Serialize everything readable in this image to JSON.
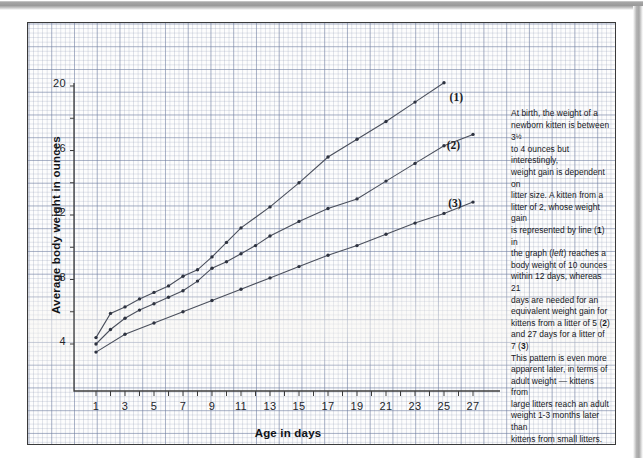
{
  "figure": {
    "x_axis_title": "Age in days",
    "y_axis_title": "Average body weight in ounces"
  },
  "note": {
    "paragraph": "At birth, the weight of a newborn kitten is between 3½ to 4 ounces but interestingly, weight gain is dependent on litter size. A kitten from a litter of 2, whose weight gain is represented by line (1) in the graph (left) reaches a body weight of 10 ounces within 12 days, whereas 21 days are needed for an equivalent weight gain for kittens from a litter of 5 (2) and 27 days for a litter of 7 (3). This pattern is even more apparent later, in terms of adult weight — kittens from large litters reach an adult weight 1-3 months later than kittens from small litters.",
    "lines": [
      "At birth, the weight of a",
      "newborn kitten is between 3½",
      "to 4 ounces but interestingly,",
      "weight gain is dependent on",
      "litter size. A kitten from a",
      "litter of 2, whose weight gain",
      "is represented by line (1) in",
      "the graph (left) reaches a",
      "body weight of 10 ounces",
      "within 12 days, whereas 21",
      "days are needed for an",
      "equivalent weight gain for",
      "kittens from a litter of 5 (2)",
      "and 27 days for a litter of 7 (3)",
      "This pattern is even more",
      "apparent later, in terms of",
      "adult weight — kittens from",
      "large litters reach an adult",
      "weight 1-3 months later than",
      "kittens from small litters."
    ]
  },
  "chart_data": {
    "type": "line",
    "title": "",
    "xlabel": "Age in days",
    "ylabel": "Average body weight in ounces",
    "xlim": [
      0,
      28
    ],
    "ylim": [
      2,
      21
    ],
    "xticks": [
      1,
      2,
      3,
      4,
      5,
      6,
      7,
      8,
      9,
      10,
      11,
      12,
      13,
      14,
      15,
      16,
      17,
      18,
      19,
      20,
      21,
      22,
      23,
      24,
      25,
      26,
      27
    ],
    "xtick_labels": [
      "1",
      "",
      "3",
      "",
      "5",
      "",
      "7",
      "",
      "9",
      "",
      "11",
      "",
      "13",
      "",
      "15",
      "",
      "17",
      "",
      "19",
      "",
      "21",
      "",
      "23",
      "",
      "25",
      "",
      "27"
    ],
    "yticks": [
      4,
      6,
      8,
      10,
      12,
      14,
      16,
      18,
      20
    ],
    "ytick_labels": [
      "4",
      "",
      "8",
      "",
      "12",
      "",
      "16",
      "",
      "20"
    ],
    "grid": true,
    "grid_style": "graph-paper",
    "legend": "inline-labels",
    "series": [
      {
        "name": "(1)",
        "label": "Litter of 2",
        "label_position": {
          "x": 25.8,
          "y": 19.2
        },
        "x": [
          1,
          2,
          3,
          4,
          5,
          6,
          7,
          8,
          9,
          10,
          11,
          13,
          15,
          17,
          19,
          21,
          23,
          25
        ],
        "y": [
          4.4,
          5.9,
          6.3,
          6.8,
          7.2,
          7.6,
          8.2,
          8.6,
          9.4,
          10.3,
          11.2,
          12.5,
          14.0,
          15.6,
          16.7,
          17.8,
          19.0,
          20.2
        ]
      },
      {
        "name": "(2)",
        "label": "Litter of 5",
        "label_position": {
          "x": 25.6,
          "y": 16.2
        },
        "x": [
          1,
          2,
          3,
          4,
          5,
          6,
          7,
          8,
          9,
          10,
          11,
          12,
          13,
          15,
          17,
          19,
          21,
          23,
          25,
          27
        ],
        "y": [
          4.0,
          4.9,
          5.6,
          6.1,
          6.5,
          6.9,
          7.3,
          7.9,
          8.7,
          9.1,
          9.6,
          10.1,
          10.7,
          11.6,
          12.4,
          13.0,
          14.1,
          15.2,
          16.3,
          17.0
        ]
      },
      {
        "name": "(3)",
        "label": "Litter of 7",
        "label_position": {
          "x": 25.7,
          "y": 12.6
        },
        "x": [
          1,
          3,
          5,
          7,
          9,
          11,
          13,
          15,
          17,
          19,
          21,
          23,
          25,
          27
        ],
        "y": [
          3.5,
          4.6,
          5.3,
          6.0,
          6.7,
          7.4,
          8.1,
          8.8,
          9.5,
          10.1,
          10.8,
          11.5,
          12.1,
          12.8
        ]
      }
    ]
  }
}
